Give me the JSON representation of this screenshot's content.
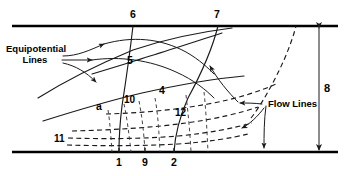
{
  "figure": {
    "type": "flow-net",
    "colors": {
      "ink": "#000000",
      "line": "#1a1a1a",
      "dashed": "#3a3a3a",
      "background": "#ffffff"
    },
    "boundaries": {
      "top_label": "top boundary line",
      "bottom_label": "bottom boundary line"
    },
    "callouts": [
      {
        "id": "equipotential",
        "line1": "Equipotential",
        "line2": "Lines",
        "arrow_count": 3,
        "position": "left"
      },
      {
        "id": "flow-lines",
        "line1": "Flow Lines",
        "line2": "",
        "arrow_count": 2,
        "position": "right"
      }
    ],
    "labels": {
      "top": [
        {
          "text": "6",
          "x": 130,
          "y": 10
        },
        {
          "text": "7",
          "x": 214,
          "y": 10
        }
      ],
      "bottom": [
        {
          "text": "1",
          "x": 116,
          "y": 158
        },
        {
          "text": "9",
          "x": 143,
          "y": 158
        },
        {
          "text": "2",
          "x": 172,
          "y": 158
        }
      ],
      "interior": [
        {
          "text": "5",
          "x": 128,
          "y": 60
        },
        {
          "text": "4",
          "x": 160,
          "y": 90
        },
        {
          "text": "a",
          "x": 97,
          "y": 106
        },
        {
          "text": "10",
          "x": 126,
          "y": 99
        },
        {
          "text": "12",
          "x": 176,
          "y": 113
        },
        {
          "text": "11",
          "x": 57,
          "y": 139
        }
      ]
    },
    "dimension": {
      "label": "8",
      "orientation": "vertical",
      "arrowheads": "both",
      "x": 319,
      "top_y": 26,
      "bottom_y": 152
    }
  }
}
